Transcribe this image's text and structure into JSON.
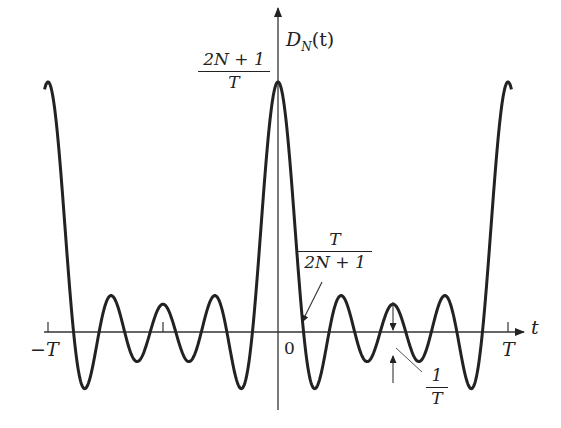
{
  "chart_data": {
    "type": "line",
    "function": "D_N(t) = (1/T) * sin((2N+1)*pi*t/T) / sin(pi*t/T)",
    "N": 4,
    "x_range": [
      "-T",
      "T"
    ],
    "xlabel": "t",
    "ylabel": "D_N(t)",
    "x_ticks": [
      "-T",
      "0",
      "T"
    ],
    "peak_value": "(2N+1)/T",
    "annotations": [
      {
        "label": "(2N+1)/T",
        "meaning": "peak height at t=0"
      },
      {
        "label": "T/(2N+1)",
        "meaning": "first zero crossing"
      },
      {
        "label": "1/T",
        "meaning": "minimum amplitude of oscillation"
      }
    ],
    "grid": false,
    "legend": null
  },
  "labels": {
    "y_axis": "D",
    "y_axis_sub": "N",
    "y_axis_arg": "(t)",
    "x_axis": "t",
    "neg_T": "−T",
    "zero": "0",
    "pos_T": "T",
    "peak_num": "2N + 1",
    "peak_den": "T",
    "zero_num": "T",
    "zero_den": "2N + 1",
    "amp_num": "1",
    "amp_den": "T"
  }
}
